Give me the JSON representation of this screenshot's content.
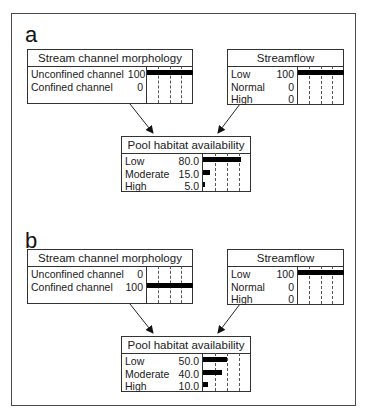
{
  "panels": [
    {
      "label": "a",
      "parents": [
        {
          "title": "Stream channel morphology",
          "states": [
            {
              "name": "Unconfined channel",
              "value": "100",
              "pct": 100
            },
            {
              "name": "Confined channel",
              "value": "0",
              "pct": 0
            }
          ]
        },
        {
          "title": "Streamflow",
          "states": [
            {
              "name": "Low",
              "value": "100",
              "pct": 100
            },
            {
              "name": "Normal",
              "value": "0",
              "pct": 0
            },
            {
              "name": "High",
              "value": "0",
              "pct": 0
            }
          ]
        }
      ],
      "child": {
        "title": "Pool habitat availability",
        "states": [
          {
            "name": "Low",
            "value": "80.0",
            "pct": 80
          },
          {
            "name": "Moderate",
            "value": "15.0",
            "pct": 15
          },
          {
            "name": "High",
            "value": "5.0",
            "pct": 5
          }
        ]
      }
    },
    {
      "label": "b",
      "parents": [
        {
          "title": "Stream channel morphology",
          "states": [
            {
              "name": "Unconfined channel",
              "value": "0",
              "pct": 0
            },
            {
              "name": "Confined channel",
              "value": "100",
              "pct": 100
            }
          ]
        },
        {
          "title": "Streamflow",
          "states": [
            {
              "name": "Low",
              "value": "100",
              "pct": 100
            },
            {
              "name": "Normal",
              "value": "0",
              "pct": 0
            },
            {
              "name": "High",
              "value": "0",
              "pct": 0
            }
          ]
        }
      ],
      "child": {
        "title": "Pool habitat availability",
        "states": [
          {
            "name": "Low",
            "value": "50.0",
            "pct": 50
          },
          {
            "name": "Moderate",
            "value": "40.0",
            "pct": 40
          },
          {
            "name": "High",
            "value": "10.0",
            "pct": 10
          }
        ]
      }
    }
  ]
}
